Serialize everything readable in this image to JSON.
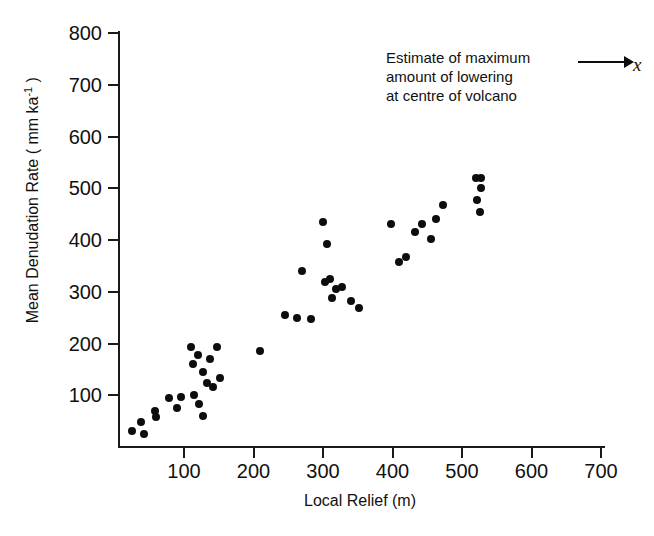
{
  "chart": {
    "type": "scatter",
    "title": "",
    "xlabel": "Local Relief (m)",
    "ylabel_prefix": "Mean Denudation Rate ( mm ka",
    "ylabel_exponent": "-1",
    "ylabel_suffix": " )",
    "annotation": {
      "line1": "Estimate of maximum",
      "line2": "amount of lowering",
      "line3": "at centre of volcano",
      "marker_label": "x",
      "marker_x": 745,
      "marker_y": 750
    },
    "point_color": "#0d0d0d",
    "axis_color": "#1a1a1a"
  },
  "axes": {
    "x_ticks": [
      "100",
      "200",
      "300",
      "400",
      "500",
      "600",
      "700"
    ],
    "x_tick_values": [
      100,
      200,
      300,
      400,
      500,
      600,
      700
    ],
    "y_ticks": [
      "100",
      "200",
      "300",
      "400",
      "500",
      "600",
      "700",
      "800"
    ],
    "y_tick_values": [
      100,
      200,
      300,
      400,
      500,
      600,
      700,
      800
    ],
    "xlim": [
      0,
      710
    ],
    "ylim": [
      0,
      800
    ],
    "grid": false
  },
  "chart_data": {
    "type": "scatter",
    "title": "",
    "xlabel": "Local Relief (m)",
    "ylabel": "Mean Denudation Rate ( mm ka^-1 )",
    "xlim": [
      0,
      710
    ],
    "ylim": [
      0,
      800
    ],
    "grid": false,
    "legend": "none",
    "annotations": [
      {
        "text": "Estimate of maximum amount of lowering at centre of volcano",
        "marker": "x",
        "points_to_x": 745,
        "points_to_y": 750
      }
    ],
    "series": [
      {
        "name": "Volcano denudation observations",
        "marker": "filled-circle",
        "color": "#0d0d0d",
        "points": [
          {
            "x": 25,
            "y": 30
          },
          {
            "x": 43,
            "y": 25
          },
          {
            "x": 38,
            "y": 48
          },
          {
            "x": 58,
            "y": 70
          },
          {
            "x": 60,
            "y": 58
          },
          {
            "x": 78,
            "y": 95
          },
          {
            "x": 90,
            "y": 75
          },
          {
            "x": 95,
            "y": 97
          },
          {
            "x": 110,
            "y": 193
          },
          {
            "x": 113,
            "y": 160
          },
          {
            "x": 115,
            "y": 100
          },
          {
            "x": 120,
            "y": 178
          },
          {
            "x": 122,
            "y": 83
          },
          {
            "x": 127,
            "y": 145
          },
          {
            "x": 128,
            "y": 60
          },
          {
            "x": 133,
            "y": 123
          },
          {
            "x": 137,
            "y": 170
          },
          {
            "x": 142,
            "y": 115
          },
          {
            "x": 148,
            "y": 193
          },
          {
            "x": 152,
            "y": 133
          },
          {
            "x": 210,
            "y": 185
          },
          {
            "x": 245,
            "y": 255
          },
          {
            "x": 262,
            "y": 250
          },
          {
            "x": 270,
            "y": 340
          },
          {
            "x": 283,
            "y": 248
          },
          {
            "x": 300,
            "y": 435
          },
          {
            "x": 303,
            "y": 318
          },
          {
            "x": 306,
            "y": 392
          },
          {
            "x": 310,
            "y": 325
          },
          {
            "x": 313,
            "y": 288
          },
          {
            "x": 318,
            "y": 305
          },
          {
            "x": 328,
            "y": 310
          },
          {
            "x": 340,
            "y": 283
          },
          {
            "x": 352,
            "y": 268
          },
          {
            "x": 398,
            "y": 430
          },
          {
            "x": 410,
            "y": 358
          },
          {
            "x": 420,
            "y": 368
          },
          {
            "x": 432,
            "y": 415
          },
          {
            "x": 443,
            "y": 430
          },
          {
            "x": 455,
            "y": 402
          },
          {
            "x": 463,
            "y": 440
          },
          {
            "x": 472,
            "y": 468
          },
          {
            "x": 520,
            "y": 520
          },
          {
            "x": 527,
            "y": 520
          },
          {
            "x": 528,
            "y": 500
          },
          {
            "x": 521,
            "y": 478
          },
          {
            "x": 526,
            "y": 455
          }
        ]
      }
    ]
  }
}
